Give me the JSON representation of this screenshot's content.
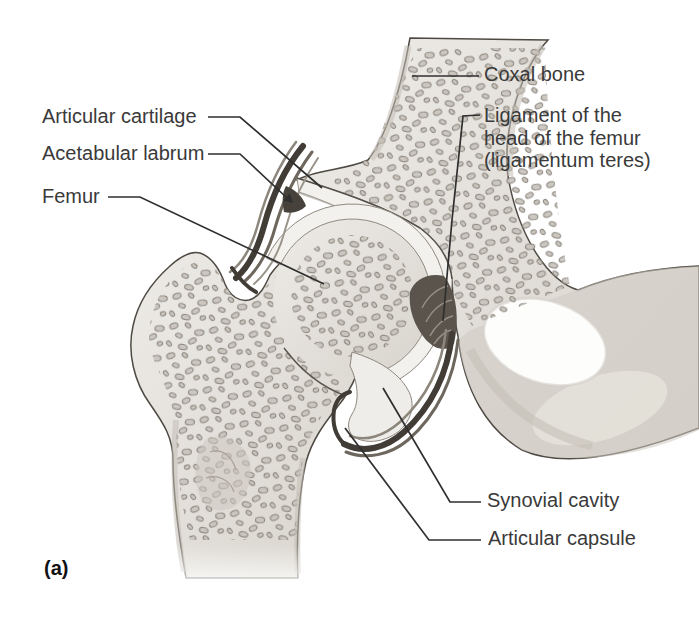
{
  "panel": {
    "label": "(a)"
  },
  "labels": {
    "articular_cartilage": "Articular cartilage",
    "acetabular_labrum": "Acetabular labrum",
    "femur": "Femur",
    "coxal_bone": "Coxal bone",
    "ligament_head": "Ligament of the head of the femur (ligamentum teres)",
    "synovial_cavity": "Synovial cavity",
    "articular_capsule": "Articular capsule"
  },
  "style": {
    "background": "#ffffff",
    "label_color": "#3a3a3a",
    "leader_color": "#2f2f2f",
    "bone_outline": "#4e4942",
    "cartilage_fill": "#f2f1ed",
    "spot_fill": "#c9c5be",
    "spot_outline": "#847e75",
    "capsule_dark": "#3b362f"
  }
}
